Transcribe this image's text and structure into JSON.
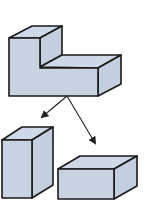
{
  "diagram": {
    "colors": {
      "fill_front": "#c8d2e1",
      "fill_top": "#cfd8e6",
      "fill_side": "#c3cede",
      "outline": "#1a1a1a",
      "arrow": "#222222"
    },
    "shapes": [
      {
        "id": "l-shaped-solid",
        "label": ""
      },
      {
        "id": "tall-block",
        "label": ""
      },
      {
        "id": "flat-block",
        "label": ""
      }
    ],
    "arrows": [
      {
        "from": "l-shaped-solid",
        "to": "tall-block"
      },
      {
        "from": "l-shaped-solid",
        "to": "flat-block"
      }
    ]
  }
}
